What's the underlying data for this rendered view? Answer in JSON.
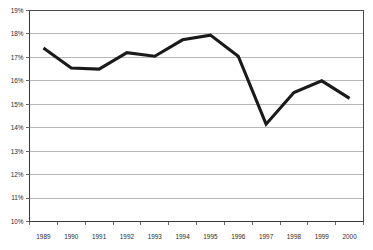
{
  "chart_data": {
    "type": "line",
    "title": "",
    "subtitle": "",
    "xlabel": "",
    "ylabel": "",
    "categories": [
      "1989",
      "1990",
      "1991",
      "1992",
      "1993",
      "1994",
      "1995",
      "1996",
      "1997",
      "1998",
      "1999",
      "2000"
    ],
    "series": [
      {
        "name": "",
        "values": [
          17.4,
          16.55,
          16.5,
          17.2,
          17.05,
          17.75,
          17.95,
          17.05,
          14.15,
          15.5,
          16.0,
          15.25
        ]
      }
    ],
    "ylim": [
      10,
      19
    ],
    "ytick_step": 1,
    "ytick_labels": [
      "19%",
      "18%",
      "17%",
      "16%",
      "15%",
      "14%",
      "13%",
      "12%",
      "11%",
      "10%"
    ],
    "ytick_values": [
      19,
      18,
      17,
      16,
      15,
      14,
      13,
      12,
      11,
      10
    ],
    "grid": true,
    "grid_axis": "y",
    "legend": "none",
    "value_suffix": "%",
    "line_color": "#1a1a1a",
    "gridline_color": "#9a9a9a",
    "border_color": "#4a4a4a",
    "background_color": "#ffffff"
  }
}
